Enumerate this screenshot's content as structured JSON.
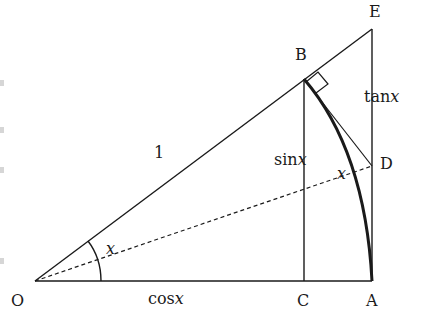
{
  "diagram": {
    "points": {
      "O": {
        "label": "O",
        "x": 35,
        "y": 281
      },
      "A": {
        "label": "A",
        "x": 372,
        "y": 281
      },
      "B": {
        "label": "B",
        "x": 304,
        "y": 79
      },
      "C": {
        "label": "C",
        "x": 304,
        "y": 281
      },
      "D": {
        "label": "D",
        "x": 372,
        "y": 166
      },
      "E": {
        "label": "E",
        "x": 372,
        "y": 29
      }
    },
    "segment_labels": {
      "radius": "1",
      "sin": "sin",
      "cos": "cos",
      "tan": "tan",
      "var": "x",
      "angle_at_O": "x",
      "angle_at_D": "x"
    },
    "colors": {
      "stroke": "#1a1a1a",
      "background": "#ffffff"
    }
  }
}
